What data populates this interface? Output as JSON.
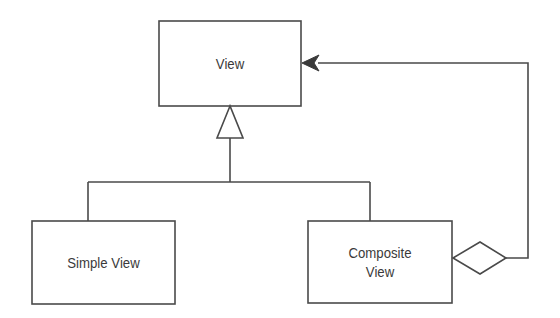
{
  "diagram": {
    "type": "uml-class-diagram",
    "colors": {
      "stroke": "#4a4a4a",
      "text": "#3a3a3a",
      "background": "#ffffff"
    },
    "nodes": [
      {
        "id": "view",
        "label": "View"
      },
      {
        "id": "simple_view",
        "label": "Simple View"
      },
      {
        "id": "composite_view",
        "label_line1": "Composite",
        "label_line2": "View"
      }
    ],
    "edges": [
      {
        "from": "simple_view",
        "to": "view",
        "kind": "generalization"
      },
      {
        "from": "composite_view",
        "to": "view",
        "kind": "generalization"
      },
      {
        "from": "composite_view",
        "to": "view",
        "kind": "aggregation"
      }
    ]
  }
}
